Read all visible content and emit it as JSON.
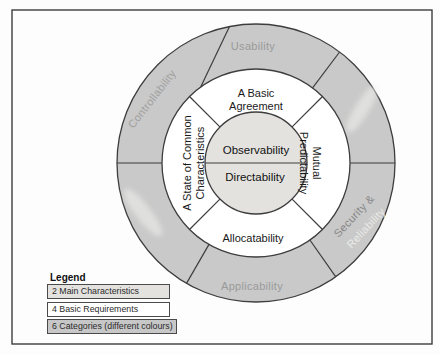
{
  "diagram": {
    "center": {
      "top_label": "Observability",
      "bottom_label": "Directability"
    },
    "requirements": {
      "top": {
        "line1": "A Basic",
        "line2": "Agreement"
      },
      "left": {
        "line1": "A State of Common",
        "line2": "Characteristics"
      },
      "right": {
        "line1": "Mutual",
        "line2": "Predictability"
      },
      "bottom": "Allocatability"
    },
    "categories": {
      "top": "Usability",
      "upper_left": "Controllability",
      "lower_left": "",
      "bottom": "Applicability",
      "lower_right": {
        "line1": "Security &",
        "line2": "Reliability"
      },
      "upper_right": ""
    }
  },
  "legend": {
    "title": "Legend",
    "items": [
      {
        "label": "2 Main Characteristics",
        "fill": "#e3e2df"
      },
      {
        "label": "4 Basic Requirements",
        "fill": "#ffffff"
      },
      {
        "label": "6 Categories (different colours)",
        "fill": "#c7c7c7"
      }
    ]
  },
  "colors": {
    "outer_ring": "#c9c9c9",
    "middle_ring": "#ffffff",
    "inner_circle": "#e3e2df",
    "category_text": "#9a9a9a",
    "security_text": "#878787",
    "reliability_text": "#e9e9e7"
  }
}
